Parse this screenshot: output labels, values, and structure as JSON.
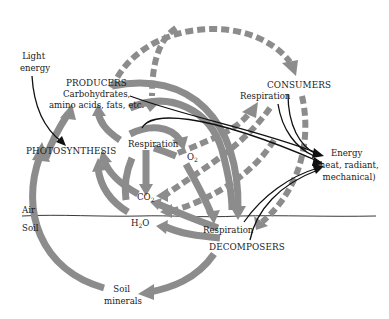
{
  "diagram": {
    "nodes": {
      "light_energy": [
        "Light",
        "energy"
      ],
      "producers": {
        "title": "PRODUCERS",
        "line1": "Carbohydrates,",
        "line2": "amino acids, fats, etc."
      },
      "photosynthesis": "PHOTOSYNTHESIS",
      "producer_respiration": "Respiration",
      "o2": {
        "base": "O",
        "sub": "2"
      },
      "co2": {
        "base": "CO",
        "sub": "2"
      },
      "h2o": {
        "base": "H",
        "sub": "2",
        "tail": "O"
      },
      "consumers": {
        "title": "CONSUMERS",
        "respiration": "Respiration"
      },
      "decomposers": {
        "title": "DECOMPOSERS",
        "respiration": "Respiration"
      },
      "energy": [
        "Energy",
        "(heat, radiant,",
        "mechanical)"
      ],
      "soil_minerals": [
        "Soil",
        "minerals"
      ],
      "air_label": "Air",
      "soil_label": "Soil"
    },
    "legend": {
      "solid_gray_arrow": "material flow (producers / decomposers)",
      "dashed_gray_arrow": "material flow (consumers)",
      "thin_black_arrow": "energy flow"
    },
    "colors": {
      "flow_gray": "#8c8c8c",
      "energy_black": "#111111",
      "text": "#1a1a1a"
    }
  }
}
